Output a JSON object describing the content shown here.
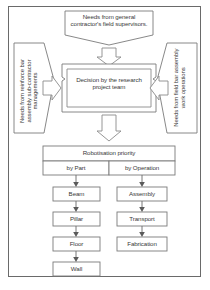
{
  "diagram": {
    "title_inputs": {
      "top": "Needs from general contractor's field supervisors.",
      "left": "Needs from reinforce bar assembly sub-contractor managements",
      "right": "Needs from field bar assembly work operations"
    },
    "decision": "Decision by the research project team",
    "priority": {
      "header": "Robotisation priority",
      "columns": [
        {
          "label": "by Part",
          "items": [
            "Beam",
            "Pillar",
            "Floor",
            "Wall"
          ]
        },
        {
          "label": "by Operation",
          "items": [
            "Assembly",
            "Transport",
            "Fabrication"
          ]
        }
      ]
    },
    "arrows": {
      "top_down": "down-block-arrow",
      "left_in": "right-block-arrow",
      "right_in": "left-block-arrow",
      "decision_down": "down-block-arrow"
    },
    "colors": {
      "stroke": "#7a7a7a",
      "text": "#3a3a3a",
      "background": "#ffffff"
    }
  }
}
